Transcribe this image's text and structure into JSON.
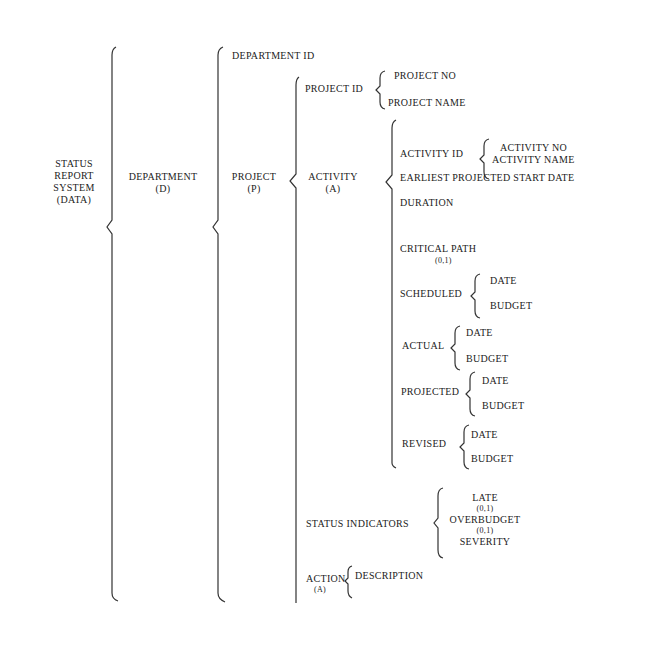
{
  "diagram": {
    "root": {
      "label_lines": [
        "STATUS",
        "REPORT",
        "SYSTEM",
        "(DATA)"
      ]
    },
    "department": {
      "label": "DEPARTMENT",
      "abbr": "(D)"
    },
    "project": {
      "label": "PROJECT",
      "abbr": "(P)"
    },
    "activity": {
      "label": "ACTIVITY",
      "abbr": "(A)"
    },
    "department_id": "DEPARTMENT ID",
    "project_id": {
      "label": "PROJECT ID",
      "children": [
        "PROJECT NO",
        "PROJECT NAME"
      ]
    },
    "activity_id": {
      "label": "ACTIVITY ID",
      "children": [
        "ACTIVITY NO",
        "ACTIVITY NAME"
      ]
    },
    "earliest_start": "EARLIEST PROJECTED START DATE",
    "duration": "DURATION",
    "critical_path": {
      "label": "CRITICAL PATH",
      "values": "(0,1)"
    },
    "scheduled": {
      "label": "SCHEDULED",
      "children": [
        "DATE",
        "BUDGET"
      ]
    },
    "actual": {
      "label": "ACTUAL",
      "children": [
        "DATE",
        "BUDGET"
      ]
    },
    "projected": {
      "label": "PROJECTED",
      "children": [
        "DATE",
        "BUDGET"
      ]
    },
    "revised": {
      "label": "REVISED",
      "children": [
        "DATE",
        "BUDGET"
      ]
    },
    "status_indicators": {
      "label": "STATUS INDICATORS",
      "children": [
        "LATE",
        "(0,1)",
        "OVERBUDGET",
        "(0,1)",
        "SEVERITY"
      ]
    },
    "action": {
      "label": "ACTION",
      "abbr": "(A)",
      "children": [
        "DESCRIPTION"
      ]
    }
  }
}
